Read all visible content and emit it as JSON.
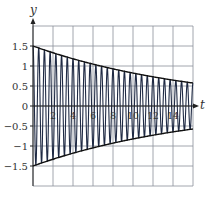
{
  "chart_data": {
    "type": "line",
    "title": "",
    "xlabel": "t",
    "ylabel": "y",
    "xlim": [
      0,
      16
    ],
    "ylim": [
      -2,
      2
    ],
    "grid": true,
    "legend": null,
    "x_ticks": [
      2,
      4,
      6,
      8,
      10,
      12,
      14
    ],
    "x_tick_labels": [
      "2",
      "4",
      "6",
      "8",
      "10",
      "12",
      "14"
    ],
    "y_ticks": [
      1.5,
      1,
      0.5,
      0,
      -0.5,
      -1,
      -1.5
    ],
    "y_tick_labels": [
      "1.5",
      "1",
      "0.5",
      "0",
      "−0.5",
      "−1",
      "−1.5"
    ],
    "series": [
      {
        "name": "damped oscillation",
        "description": "y = 1.5·e^(-0.06t)·cos(2π·1.75·t)",
        "amplitude0": 1.5,
        "decay_rate": 0.06,
        "frequency_cycles_per_unit": 1.75,
        "color": "#1f2a44"
      },
      {
        "name": "upper envelope",
        "description": "y = 1.5·e^(-0.06t)",
        "points": [
          [
            0,
            1.5
          ],
          [
            4,
            1.18
          ],
          [
            8,
            0.93
          ],
          [
            12,
            0.73
          ],
          [
            16,
            0.57
          ]
        ],
        "color": "#111111"
      },
      {
        "name": "lower envelope",
        "description": "y = -1.5·e^(-0.06t)",
        "points": [
          [
            0,
            -1.5
          ],
          [
            4,
            -1.18
          ],
          [
            8,
            -0.93
          ],
          [
            12,
            -0.73
          ],
          [
            16,
            -0.57
          ]
        ],
        "color": "#111111"
      }
    ]
  },
  "colors": {
    "grid": "#8a8f99",
    "axis": "#222222",
    "curve": "#1f2a44",
    "envelope": "#111111"
  }
}
